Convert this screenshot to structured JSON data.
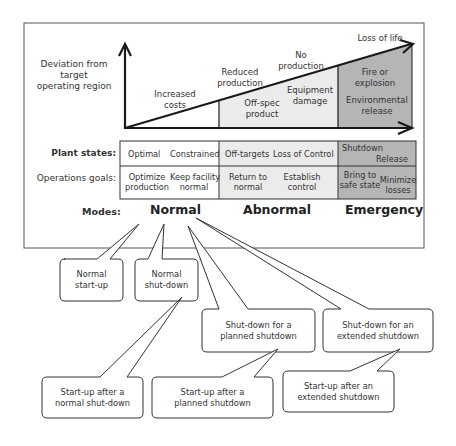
{
  "diagram": {
    "y_axis_label": [
      "Deviation from",
      "target",
      "operating region"
    ],
    "consequences": {
      "increased_costs": [
        "Increased",
        "costs"
      ],
      "reduced_production": [
        "Reduced",
        "production"
      ],
      "no_production": [
        "No",
        "production"
      ],
      "loss_of_life": "Loss of life",
      "off_spec_product": [
        "Off-spec",
        "product"
      ],
      "equipment_damage": [
        "Equipment",
        "damage"
      ],
      "fire_or_explosion": [
        "Fire or",
        "explosion"
      ],
      "environmental_release": [
        "Environmental",
        "release"
      ]
    },
    "colors": {
      "normal_fill": "#ffffff",
      "abnormal_fill": "#ebebeb",
      "emergency_fill": "#b5b5b5",
      "line": "#1a1a1a"
    },
    "table": {
      "row_labels": {
        "plant_states": "Plant states:",
        "operations_goals": "Operations goals:"
      },
      "plant_states": {
        "normal": [
          "Optimal",
          "Constrained"
        ],
        "abnormal": [
          "Off-targets",
          "Loss of Control"
        ],
        "emergency": [
          "Shutdown",
          "Release"
        ]
      },
      "operations_goals": {
        "normal": [
          [
            "Optimize",
            "production"
          ],
          [
            "Keep facility",
            "normal"
          ]
        ],
        "abnormal": [
          [
            "Return to",
            "normal"
          ],
          [
            "Establish",
            "control"
          ]
        ],
        "emergency": [
          [
            "Bring to",
            "safe state"
          ],
          [
            "Minimize",
            "losses"
          ]
        ]
      }
    },
    "modes": {
      "label": "Modes:",
      "normal": "Normal",
      "abnormal": "Abnormal",
      "emergency": "Emergency"
    },
    "callouts": {
      "normal_startup": [
        "Normal",
        "start-up"
      ],
      "normal_shutdown": [
        "Normal",
        "shut-down"
      ],
      "planned_shutdown": [
        "Shut-down for a",
        "planned shutdown"
      ],
      "extended_shutdown": [
        "Shut-down for an",
        "extended shutdown"
      ],
      "startup_after_normal": [
        "Start-up after a",
        "normal shut-down"
      ],
      "startup_after_planned": [
        "Start-up after a",
        "planned shutdown"
      ],
      "startup_after_extended": [
        "Start-up after an",
        "extended shutdown"
      ]
    }
  }
}
